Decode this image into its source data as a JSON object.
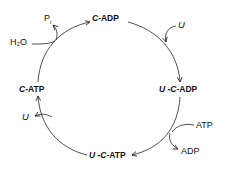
{
  "diagram": {
    "type": "reaction-cycle",
    "direction": "clockwise",
    "states": [
      {
        "id": "c_adp",
        "prefix_italic": "C",
        "suffix": "-ADP",
        "position": "top"
      },
      {
        "id": "u_c_adp",
        "prefix_italic": "U -C",
        "suffix": "-ADP",
        "position": "right"
      },
      {
        "id": "u_c_atp",
        "prefix_italic": "U -C",
        "suffix": "-ATP",
        "position": "bottom"
      },
      {
        "id": "c_atp",
        "prefix_italic": "C",
        "suffix": "-ATP",
        "position": "left"
      }
    ],
    "side_reactions": [
      {
        "step": "c_adp_to_u_c_adp",
        "in": "U",
        "in_italic": true
      },
      {
        "step": "u_c_adp_to_u_c_atp",
        "in": "ATP",
        "out": "ADP"
      },
      {
        "step": "u_c_atp_to_c_atp",
        "out": "U",
        "out_italic": true
      },
      {
        "step": "c_atp_to_c_adp",
        "in": "H₂O",
        "out": "P",
        "out_subscript": "i"
      }
    ]
  },
  "labels": {
    "c_adp_prefix": "C",
    "c_adp_suffix": "-ADP",
    "u_c_adp_prefix": "U -C",
    "u_c_adp_suffix": "-ADP",
    "u_c_atp_prefix": "U -C",
    "u_c_atp_suffix": "-ATP",
    "c_atp_prefix": "C",
    "c_atp_suffix": "-ATP",
    "u_in": "U",
    "u_out": "U",
    "atp_in": "ATP",
    "adp_out": "ADP",
    "h2o_in": "H₂O",
    "pi_out": "P",
    "pi_sub": "i"
  }
}
